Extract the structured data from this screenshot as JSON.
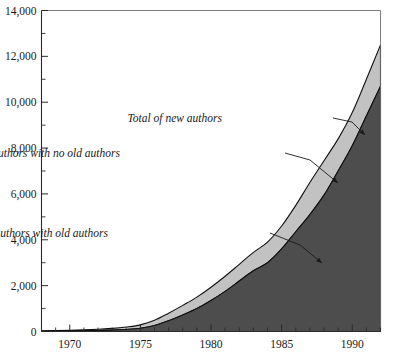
{
  "chart_data": {
    "type": "area",
    "stacked": true,
    "title": "",
    "subtitle": "",
    "xlabel": "",
    "ylabel": "",
    "xlim": [
      1968,
      1992
    ],
    "ylim": [
      0,
      14000
    ],
    "grid": false,
    "legend_position": "inline-annotations",
    "x_tick_labels": [
      "1970",
      "1975",
      "1980",
      "1985",
      "1990"
    ],
    "x_tick_values": [
      1970,
      1975,
      1980,
      1985,
      1990
    ],
    "x_minor_tick_step": 1,
    "y_tick_labels": [
      "0",
      "2,000",
      "4,000",
      "6,000",
      "8,000",
      "10,000",
      "12,000",
      "14,000"
    ],
    "y_tick_values": [
      0,
      2000,
      4000,
      6000,
      8000,
      10000,
      12000,
      14000
    ],
    "y_minor_tick_step": 1000,
    "x": [
      1968,
      1969,
      1970,
      1971,
      1972,
      1973,
      1974,
      1975,
      1976,
      1977,
      1978,
      1979,
      1980,
      1981,
      1982,
      1983,
      1984,
      1985,
      1986,
      1987,
      1988,
      1989,
      1990,
      1991,
      1992
    ],
    "series": [
      {
        "name": "New authors with old authors",
        "color": "#4d4d4d",
        "values": [
          10,
          15,
          20,
          30,
          45,
          60,
          90,
          140,
          260,
          470,
          720,
          1000,
          1350,
          1750,
          2200,
          2650,
          3000,
          3600,
          4350,
          5100,
          5950,
          7000,
          8100,
          9400,
          10700
        ]
      },
      {
        "name": "New authors with no old authors",
        "color": "#c2c2c2",
        "values": [
          20,
          25,
          30,
          40,
          55,
          75,
          105,
          150,
          230,
          330,
          420,
          500,
          580,
          660,
          730,
          800,
          900,
          1000,
          1150,
          1400,
          1500,
          1400,
          1450,
          1600,
          1800
        ]
      }
    ],
    "total_series": {
      "name": "Total of new authors",
      "values": [
        30,
        40,
        50,
        70,
        100,
        135,
        195,
        290,
        490,
        800,
        1140,
        1500,
        1930,
        2410,
        2930,
        3450,
        3900,
        4600,
        5500,
        6500,
        7450,
        8400,
        9550,
        11000,
        12500
      ]
    },
    "annotations": [
      {
        "id": "total-of-new-authors",
        "text": "Total of new authors",
        "text_x": 222,
        "text_y": 122,
        "leader": [
          [
            333,
            118
          ],
          [
            352,
            122
          ],
          [
            365,
            135
          ]
        ]
      },
      {
        "id": "new-authors-with-no-old-authors",
        "text": "New authors with no old authors",
        "text_x": 120,
        "text_y": 157,
        "leader": [
          [
            285,
            153
          ],
          [
            310,
            160
          ],
          [
            338,
            183
          ]
        ]
      },
      {
        "id": "new-authors-with-old-authors",
        "text": "New authors with old authors",
        "text_x": 108,
        "text_y": 237,
        "leader": [
          [
            270,
            233
          ],
          [
            300,
            245
          ],
          [
            322,
            263
          ]
        ]
      }
    ],
    "colors": {
      "dark_band": "#4d4d4d",
      "light_band": "#c2c2c2",
      "outline": "#111111",
      "axis": "#2b2b2b",
      "background": "#ffffff"
    }
  }
}
